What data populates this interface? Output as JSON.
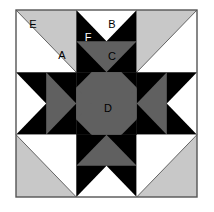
{
  "figure": {
    "kind": "pieced-quilt-block",
    "canvas": {
      "width": 214,
      "height": 212
    },
    "block": {
      "x": 16,
      "y": 10,
      "width": 181,
      "height": 187,
      "rows": 3,
      "cols": 3
    }
  },
  "palette": {
    "white": "#ffffff",
    "light_gray": "#c8c8c8",
    "medium_gray": "#606060",
    "black": "#000000",
    "outline": "#555555",
    "label_dark": "#000000",
    "label_light": "#ffffff"
  },
  "labels": [
    {
      "id": "A",
      "text": "A",
      "x": 62,
      "y": 59,
      "color": "#000000",
      "patch": "large white quarter-square triangle, top-left cell"
    },
    {
      "id": "B",
      "text": "B",
      "x": 112,
      "y": 28,
      "color": "#000000",
      "patch": "white downward triangle, top-center cell upper half"
    },
    {
      "id": "C",
      "text": "C",
      "x": 112,
      "y": 60,
      "color": "#000000",
      "patch": "medium gray downward triangle, top-center cell lower half"
    },
    {
      "id": "D",
      "text": "D",
      "x": 108,
      "y": 112,
      "color": "#000000",
      "patch": "medium gray center square"
    },
    {
      "id": "E",
      "text": "E",
      "x": 33,
      "y": 28,
      "color": "#000000",
      "patch": "light gray corner half-square triangle"
    },
    {
      "id": "F",
      "text": "F",
      "x": 88,
      "y": 41,
      "color": "#ffffff",
      "patch": "black background triangle flanking B"
    }
  ],
  "legend_keys": [
    "A",
    "B",
    "C",
    "D",
    "E",
    "F"
  ]
}
